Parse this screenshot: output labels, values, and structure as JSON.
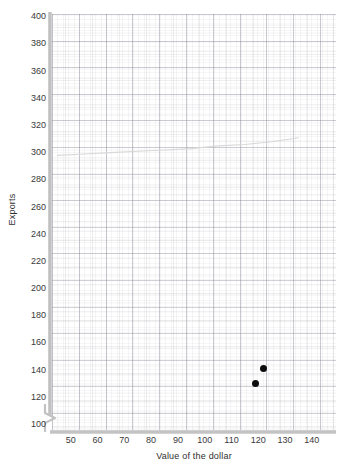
{
  "chart_data": {
    "type": "scatter",
    "title": "",
    "xlabel": "Value of the dollar",
    "ylabel": "Exports",
    "xlim": [
      43,
      149
    ],
    "ylim": [
      96,
      402
    ],
    "xticks": [
      50,
      60,
      70,
      80,
      90,
      100,
      110,
      120,
      130,
      140
    ],
    "yticks": [
      100,
      120,
      140,
      160,
      180,
      200,
      220,
      240,
      260,
      280,
      300,
      320,
      340,
      360,
      380,
      400
    ],
    "xtick_labels": [
      "50",
      "60",
      "70",
      "80",
      "90",
      "100",
      "110",
      "120",
      "130",
      "140"
    ],
    "ytick_labels": [
      "100",
      "120",
      "140",
      "160",
      "180",
      "200",
      "220",
      "240",
      "260",
      "280",
      "300",
      "320",
      "340",
      "360",
      "380",
      "400"
    ],
    "grid": true,
    "legend": null,
    "y_axis_break": true,
    "points": [
      {
        "label": "point-upper",
        "x": 122,
        "y": 141
      },
      {
        "label": "point-lower",
        "x": 119,
        "y": 130
      }
    ],
    "series": [
      {
        "name": "faint-trend-curve",
        "type": "line",
        "color": "#d8d8d8",
        "x": [
          45,
          55,
          65,
          75,
          85,
          95,
          105,
          115,
          125,
          132,
          135
        ],
        "y": [
          298,
          299,
          300,
          301,
          302,
          303,
          305,
          306,
          308,
          310,
          311
        ]
      }
    ],
    "point_color": "#0d0d0d",
    "axis_color": "#bcbcbc",
    "grid_color": "#c8c8d0",
    "background": "#ffffff"
  },
  "axis_break_symbol": "zigzag"
}
